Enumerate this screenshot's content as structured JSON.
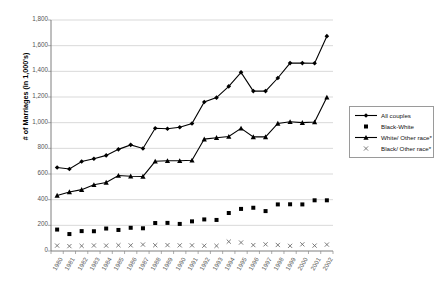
{
  "chart_data": {
    "type": "line",
    "title": "",
    "xlabel": "",
    "ylabel": "# of Marriages (in 1,000's)",
    "ylim": [
      0,
      1800
    ],
    "ytick_step": 200,
    "grid": true,
    "legend_position": "right",
    "categories": [
      "1980",
      "1981",
      "1982",
      "1983",
      "1984",
      "1985",
      "1986",
      "1987",
      "1988",
      "1989",
      "1990",
      "1991",
      "1992",
      "1993",
      "1994",
      "1995",
      "1996",
      "1997",
      "1998",
      "1999",
      "2000",
      "2001",
      "2002"
    ],
    "yticks": [
      "0",
      "200",
      "400",
      "600",
      "800",
      "1,000",
      "1,200",
      "1,400",
      "1,600",
      "1,800"
    ],
    "series": [
      {
        "name": "All couples",
        "marker": "diamond",
        "line": true,
        "values": [
          651,
          639,
          697,
          719,
          745,
          792,
          827,
          799,
          956,
          953,
          964,
          994,
          1161,
          1195,
          1283,
          1392,
          1246,
          1246,
          1348,
          1464,
          1464,
          1463,
          1674
        ]
      },
      {
        "name": "Black-White",
        "marker": "square",
        "line": false,
        "values": [
          167,
          132,
          155,
          154,
          175,
          164,
          181,
          177,
          218,
          219,
          211,
          231,
          246,
          242,
          296,
          328,
          337,
          311,
          363,
          364,
          363,
          395,
          395
        ]
      },
      {
        "name": "White/ Other race*",
        "marker": "triangle",
        "line": true,
        "values": [
          433,
          460,
          478,
          516,
          534,
          588,
          583,
          581,
          699,
          703,
          703,
          707,
          872,
          883,
          892,
          956,
          889,
          889,
          994,
          1007,
          1000,
          1005,
          1198
        ]
      },
      {
        "name": "Black/ Other race*",
        "marker": "x",
        "line": false,
        "values": [
          42,
          38,
          40,
          43,
          42,
          45,
          44,
          50,
          45,
          46,
          44,
          44,
          41,
          40,
          73,
          66,
          46,
          52,
          47,
          40,
          52,
          42,
          50
        ]
      }
    ]
  },
  "legend": {
    "items": [
      {
        "label": "All couples"
      },
      {
        "label": "Black-White"
      },
      {
        "label": "White/ Other race*"
      },
      {
        "label": "Black/ Other race*"
      }
    ]
  }
}
